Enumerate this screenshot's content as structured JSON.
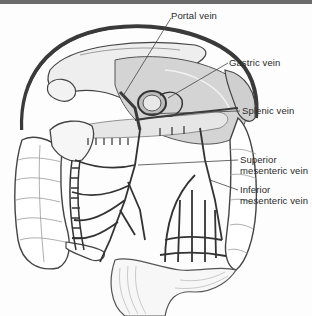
{
  "figure": {
    "top_band_color": "#6b6b6b",
    "organ_fill_color": "#d9d9d9",
    "vein_color": "#3a3a3a",
    "labels": {
      "portal_vein": "Portal vein",
      "gastric_vein": "Gastric vein",
      "splenic_vein": "Splenic vein",
      "superior_mesenteric_line1": "Superior",
      "superior_mesenteric_line2": "mesenteric vein",
      "inferior_mesenteric_line1": "Inferior",
      "inferior_mesenteric_line2": "mesenteric vein"
    }
  }
}
